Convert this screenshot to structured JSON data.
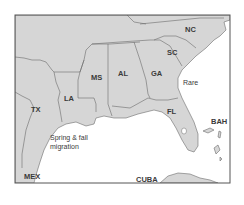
{
  "map": {
    "region": "Southeastern United States and Gulf of Mexico",
    "colors": {
      "land": "#d6d6d6",
      "water": "#ffffff",
      "border": "#6b6b6b",
      "frame": "#555555",
      "text": "#3a3a3a"
    },
    "state_labels": {
      "nc": "NC",
      "sc": "SC",
      "ga": "GA",
      "al": "AL",
      "ms": "MS",
      "la": "LA",
      "tx": "TX",
      "fl": "FL"
    },
    "country_labels": {
      "mex": "MEX",
      "cuba": "CUBA",
      "bah": "BAH"
    },
    "annotations": {
      "rare": "Rare",
      "migration_line1": "Spring & fall",
      "migration_line2": "migration"
    }
  }
}
